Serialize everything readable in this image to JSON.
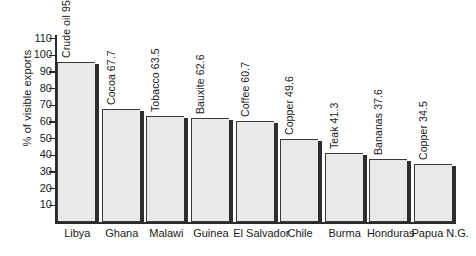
{
  "chart_data": {
    "type": "bar",
    "title": "",
    "xlabel": "",
    "ylabel": "% of visible exports",
    "ylim": [
      0,
      115
    ],
    "grid": false,
    "legend": "none",
    "yticks": [
      10,
      20,
      30,
      40,
      50,
      60,
      70,
      80,
      90,
      100,
      110
    ],
    "ytick_labels": [
      "10",
      "20",
      "30",
      "40",
      "50",
      "60",
      "70",
      "80",
      "90",
      "100",
      "110"
    ],
    "categories": [
      "Libya",
      "Ghana",
      "Malawi",
      "Guinea",
      "El Salvador",
      "Chile",
      "Burma",
      "Honduras",
      "Papua N.G."
    ],
    "values": [
      95.8,
      67.7,
      63.5,
      62.6,
      60.7,
      49.6,
      41.3,
      37.6,
      34.5
    ],
    "annotations": [
      "Crude oil 95.8",
      "Cocoa 67.7",
      "Tobacco 63.5",
      "Bauxite 62.6",
      "Coffee 60.7",
      "Copper 49.6",
      "Teak 41.3",
      "Bananas 37.6",
      "Copper 34.5"
    ],
    "commodities": [
      "Crude oil",
      "Cocoa",
      "Tobacco",
      "Bauxite",
      "Coffee",
      "Copper",
      "Teak",
      "Bananas",
      "Copper"
    ],
    "bar_fill_color": "#e9e9e9",
    "bar_edge_color": "#3a3a3a",
    "bar_shadow_color": "#2e2e2e",
    "axis_color": "#2b2b2b",
    "background_color": "#ffffff"
  }
}
